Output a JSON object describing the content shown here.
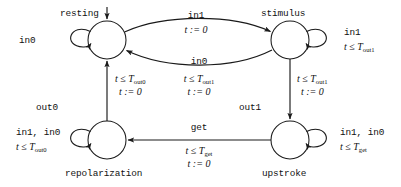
{
  "diagram": {
    "kind": "timed-automaton-state-machine",
    "states": [
      {
        "id": "resting",
        "label": "resting",
        "cx": 107,
        "cy": 40,
        "r": 19,
        "label_pos": "above-left",
        "initial": true
      },
      {
        "id": "stimulus",
        "label": "stimulus",
        "cx": 290,
        "cy": 40,
        "r": 19,
        "label_pos": "above",
        "initial": false
      },
      {
        "id": "repolarization",
        "label": "repolarization",
        "cx": 107,
        "cy": 140,
        "r": 19,
        "label_pos": "below",
        "initial": false
      },
      {
        "id": "upstroke",
        "label": "upstroke",
        "cx": 290,
        "cy": 140,
        "r": 19,
        "label_pos": "below",
        "initial": false
      }
    ],
    "self_loops": [
      {
        "id": "resting-loop",
        "state": "resting",
        "side": "left",
        "event": "in0",
        "guard": "",
        "guard_sub": "",
        "reset": ""
      },
      {
        "id": "stimulus-loop",
        "state": "stimulus",
        "side": "right",
        "event": "in1",
        "guard": "t ≤ T",
        "guard_sub": "out1",
        "reset": ""
      },
      {
        "id": "repolarization-loop",
        "state": "repolarization",
        "side": "left",
        "event": "in1, in0",
        "guard": "t ≤ T",
        "guard_sub": "out0",
        "reset": ""
      },
      {
        "id": "upstroke-loop",
        "state": "upstroke",
        "side": "right",
        "event": "in1, in0",
        "guard": "t ≤ T",
        "guard_sub": "get",
        "reset": ""
      }
    ],
    "transitions": [
      {
        "id": "resting-to-stimulus",
        "from": "resting",
        "to": "stimulus",
        "shape": "curve-up",
        "event": "in1",
        "guard": "",
        "guard_sub": "",
        "reset": "t := 0"
      },
      {
        "id": "stimulus-to-resting",
        "from": "stimulus",
        "to": "resting",
        "shape": "curve-down",
        "event": "in0",
        "guard": "t ≤ T",
        "guard_sub": "out1",
        "reset": "t := 0"
      },
      {
        "id": "stimulus-to-upstroke",
        "from": "stimulus",
        "to": "upstroke",
        "shape": "line-down",
        "event": "out1",
        "guard": "t ≤ T",
        "guard_sub": "out1",
        "reset": "t := 0"
      },
      {
        "id": "upstroke-to-repolarization",
        "from": "upstroke",
        "to": "repolarization",
        "shape": "line-left",
        "event": "get",
        "guard": "t ≤ T",
        "guard_sub": "get",
        "reset": "t := 0"
      },
      {
        "id": "repolarization-to-resting",
        "from": "repolarization",
        "to": "resting",
        "shape": "line-up",
        "event": "out0",
        "guard": "t ≤ T",
        "guard_sub": "out0",
        "reset": "t := 0"
      }
    ],
    "labels": {
      "state_resting": "resting",
      "state_stimulus": "stimulus",
      "state_repolarization": "repolarization",
      "state_upstroke": "upstroke",
      "loop_resting_event": "in0",
      "loop_stimulus_event": "in1",
      "loop_stimulus_guard": "t ≤ T",
      "loop_stimulus_guard_sub": "out1",
      "loop_repolarization_event": "in1, in0",
      "loop_repolarization_guard": "t ≤ T",
      "loop_repolarization_guard_sub": "out0",
      "loop_upstroke_event": "in1, in0",
      "loop_upstroke_guard": "t ≤ T",
      "loop_upstroke_guard_sub": "get",
      "top_event": "in1",
      "top_reset": "t := 0",
      "mid_event": "in0",
      "mid_guard": "t ≤ T",
      "mid_guard_sub": "out1",
      "mid_reset": "t := 0",
      "left_event": "out0",
      "left_guard": "t ≤ T",
      "left_guard_sub": "out0",
      "left_reset": "t := 0",
      "right_event": "out1",
      "right_guard": "t ≤ T",
      "right_guard_sub": "out1",
      "right_reset": "t := 0",
      "bottom_event": "get",
      "bottom_guard": "t ≤ T",
      "bottom_guard_sub": "get",
      "bottom_reset": "t := 0"
    },
    "colors": {
      "stroke": "#1a1a1a",
      "text": "#111111",
      "background": "#ffffff"
    }
  }
}
